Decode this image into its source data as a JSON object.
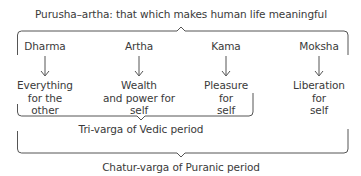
{
  "title": "Purusha–artha: that which makes human life meaningful",
  "goals": [
    {
      "name": "Dharma",
      "meaning": [
        "Everything",
        "for the",
        "other"
      ]
    },
    {
      "name": "Artha",
      "meaning": [
        "Wealth",
        "and power for",
        "self"
      ]
    },
    {
      "name": "Kama",
      "meaning": [
        "Pleasure",
        "for",
        "self"
      ]
    },
    {
      "name": "Moksha",
      "meaning": [
        "Liberation",
        "for",
        "self"
      ]
    }
  ],
  "groups": {
    "tri_varga": "Tri-varga of Vedic period",
    "chatur_varga": "Chatur-varga of Puranic period"
  },
  "colors": {
    "line": "#555555",
    "text": "#3a3a3a"
  }
}
